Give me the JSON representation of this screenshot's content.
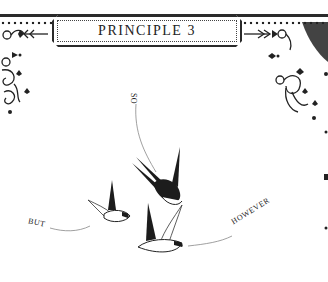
{
  "header": {
    "title": "PRINCIPLE 3"
  },
  "illustration": {
    "labels": {
      "so": "SO",
      "but": "BUT",
      "however": "HOWEVER"
    },
    "birds": [
      "swallow-diving",
      "swallow-left",
      "swallow-center"
    ]
  },
  "colors": {
    "ink": "#1a1a1a",
    "paper": "#ffffff"
  }
}
